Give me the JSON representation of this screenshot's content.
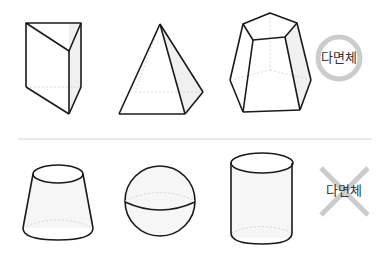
{
  "rows": [
    {
      "name": "polyhedra",
      "shapes": [
        "triangular-prism",
        "square-pyramid",
        "pentagonal-frustum"
      ],
      "badge": {
        "label": "다면체",
        "mark": "circle",
        "color": "#c8c8c8"
      }
    },
    {
      "name": "non-polyhedra",
      "shapes": [
        "cone-frustum",
        "sphere",
        "cylinder"
      ],
      "badge": {
        "label": "다면체",
        "mark": "cross",
        "color": "#c8c8c8"
      }
    }
  ],
  "colors": {
    "stroke": "#1a1a1a",
    "hidden_edge": "#cfcfcf",
    "shade": "#f0f0f0",
    "divider": "#d6d6d6"
  }
}
